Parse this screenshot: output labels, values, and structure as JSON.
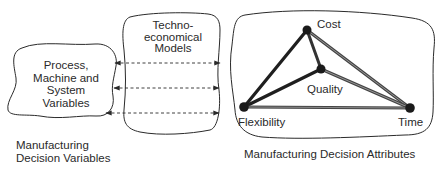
{
  "left_blob": {
    "lines": [
      "Process,",
      "Machine and",
      "System",
      "Variables"
    ]
  },
  "middle_blob": {
    "lines": [
      "Techno-",
      "economical",
      "Models"
    ]
  },
  "right_blob": {
    "nodes": {
      "cost": "Cost",
      "quality": "Quality",
      "flexibility": "Flexibility",
      "time": "Time"
    }
  },
  "captions": {
    "left_line1": "Manufacturing",
    "left_line2": "Decision Variables",
    "right": "Manufacturing Decision Attributes"
  },
  "arrows": {
    "count": 3,
    "style": "dashed",
    "directions": [
      "right-to-left and left-to-right",
      "bidirectional",
      "bidirectional"
    ]
  },
  "colors": {
    "stroke": "#2a2a2a",
    "node": "#1a1a1a",
    "edge_light": "#777777"
  }
}
